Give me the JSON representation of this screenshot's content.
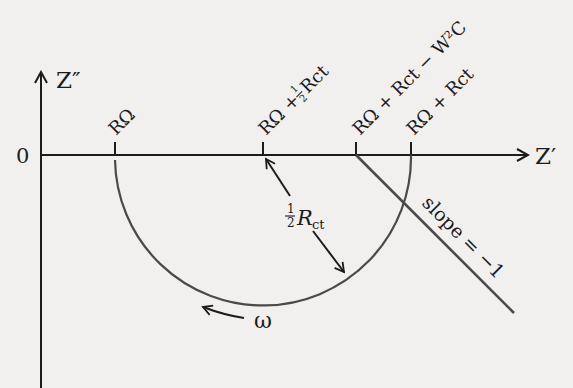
{
  "diagram": {
    "type": "Nyquist impedance plot (Randles circuit)",
    "axes": {
      "y_label": "Z″",
      "x_label": "Z′",
      "origin_label": "0"
    },
    "ticks": [
      {
        "id": "rs",
        "label": "RΩ"
      },
      {
        "id": "rs_half_rct",
        "label_main": "RΩ + ",
        "label_frac": "½",
        "label_tail": "Rᶜᵗ"
      },
      {
        "id": "rs_rct_w2c",
        "label": "RΩ + Rct − W²C"
      },
      {
        "id": "rs_rct",
        "label": "RΩ + Rct"
      }
    ],
    "tick_labels": {
      "rs": "RΩ",
      "rs_half_rct_a": "RΩ + ",
      "half": "1",
      "half_den": "2",
      "rct": "Rct",
      "rs_rct_w2c": "RΩ + Rct − W²C",
      "rs_rct": "RΩ + Rct"
    },
    "annotations": {
      "radius_num": "1",
      "radius_den": "2",
      "radius_R": "R",
      "radius_sub": "ct",
      "omega": "ω",
      "slope": "slope = −1"
    },
    "colors": {
      "ink": "#1c1c1c",
      "curve": "#4a4a4a",
      "background": "#f1f0ee"
    }
  }
}
